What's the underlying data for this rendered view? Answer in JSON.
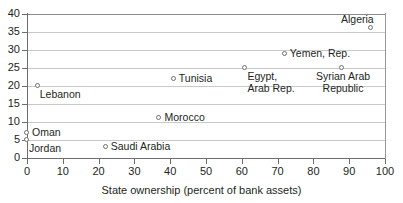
{
  "chart_data": {
    "type": "scatter",
    "title": "",
    "xlabel": "State ownership (percent of bank assets)",
    "ylabel": "",
    "xlim": [
      0,
      100
    ],
    "ylim": [
      0,
      40
    ],
    "xticks": [
      "0",
      "10",
      "20",
      "30",
      "40",
      "50",
      "60",
      "70",
      "80",
      "90",
      "100"
    ],
    "yticks": [
      "0",
      "5",
      "10",
      "15",
      "20",
      "25",
      "30",
      "35",
      "40"
    ],
    "grid": "horizontal",
    "legend": "none",
    "marker": "open-circle",
    "marker_color": "#6f6f6f",
    "grid_color": "#c9c9c9",
    "axis_color": "#6d6d6d",
    "points": [
      {
        "label": "Jordan",
        "x": 0,
        "y": 5,
        "anchor": "below-right"
      },
      {
        "label": "Oman",
        "x": 0,
        "y": 7,
        "anchor": "right"
      },
      {
        "label": "Lebanon",
        "x": 3,
        "y": 20,
        "anchor": "below-right"
      },
      {
        "label": "Saudi Arabia",
        "x": 22,
        "y": 3,
        "anchor": "right"
      },
      {
        "label": "Morocco",
        "x": 37,
        "y": 11,
        "anchor": "right"
      },
      {
        "label": "Tunisia",
        "x": 41,
        "y": 22,
        "anchor": "right"
      },
      {
        "label": "Egypt,\nArab Rep.",
        "x": 61,
        "y": 25,
        "anchor": "below-right"
      },
      {
        "label": "Yemen, Rep.",
        "x": 72,
        "y": 29,
        "anchor": "right"
      },
      {
        "label": "Syrian Arab\nRepublic",
        "x": 88,
        "y": 25,
        "anchor": "below-center"
      },
      {
        "label": "Algeria",
        "x": 96,
        "y": 36,
        "anchor": "above-left"
      }
    ]
  }
}
